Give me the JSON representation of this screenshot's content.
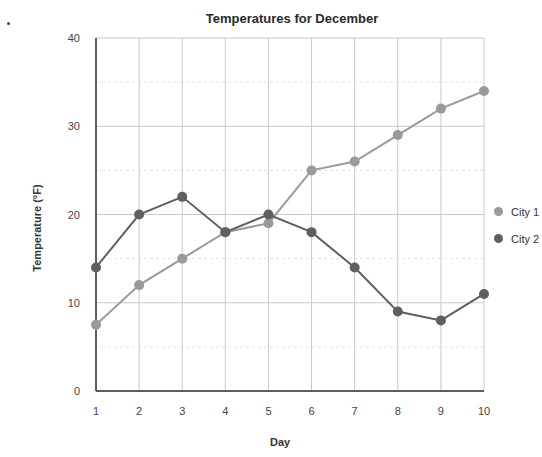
{
  "chart_data": {
    "type": "line",
    "title": "Temperatures for December",
    "xlabel": "Day",
    "ylabel": "Temperature (°F)",
    "x": [
      1,
      2,
      3,
      4,
      5,
      6,
      7,
      8,
      9,
      10
    ],
    "ylim": [
      0,
      40
    ],
    "yticks": [
      0,
      10,
      20,
      30,
      40
    ],
    "grid": true,
    "legend_position": "right",
    "series": [
      {
        "name": "City 1",
        "color": "#9a9a9a",
        "values": [
          7.5,
          12,
          15,
          18,
          19,
          25,
          26,
          29,
          32,
          34
        ]
      },
      {
        "name": "City 2",
        "color": "#5f5f5f",
        "values": [
          14,
          20,
          22,
          18,
          20,
          18,
          14,
          9,
          8,
          11
        ]
      }
    ]
  },
  "legend": {
    "items": [
      "City 1",
      "City 2"
    ]
  }
}
